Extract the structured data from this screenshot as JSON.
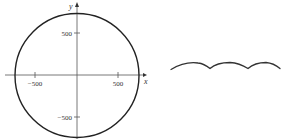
{
  "figure": {
    "left_panel": {
      "type": "circle-plot",
      "x_axis_label": "x",
      "y_axis_label": "y",
      "x_ticks": [
        "−500",
        "500"
      ],
      "y_ticks": [
        "500",
        "−500"
      ],
      "radius": 600,
      "stroke_color": "#222222"
    },
    "right_panel": {
      "type": "wavy-curve",
      "arches": 3,
      "stroke_color": "#333333"
    }
  }
}
